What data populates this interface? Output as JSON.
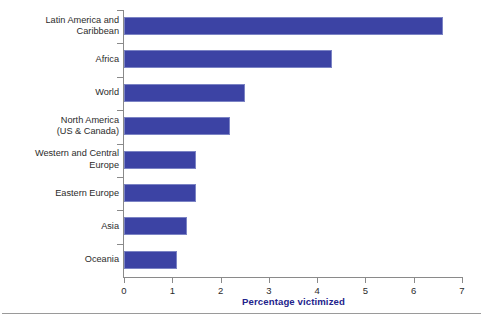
{
  "chart_data": {
    "type": "bar",
    "orientation": "horizontal",
    "title": "",
    "xlabel": "Percentage victimized",
    "ylabel": "",
    "xlim": [
      0,
      7
    ],
    "xticks": [
      "0",
      "1",
      "2",
      "3",
      "4",
      "5",
      "6",
      "7"
    ],
    "grid": false,
    "legend": null,
    "bar_color": "#3c43a4",
    "bar_border_color": "#7b83c4",
    "axis_title_color": "#23238c",
    "axis_line_color": "#8a8a8a",
    "label_color": "#2b2b2b",
    "categories": [
      "Latin America and\nCaribbean",
      "Africa",
      "World",
      "North America\n(US & Canada)",
      "Western and Central\nEurope",
      "Eastern Europe",
      "Asia",
      "Oceania"
    ],
    "values": [
      6.6,
      4.3,
      2.5,
      2.2,
      1.5,
      1.5,
      1.3,
      1.1
    ]
  }
}
